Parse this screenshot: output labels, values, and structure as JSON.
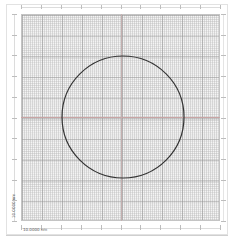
{
  "diagram": {
    "type": "grid-with-circle",
    "grid": {
      "major_divisions_x": 10,
      "major_divisions_y": 10,
      "minor_per_major": 10,
      "background": "#f4f4f4",
      "major_line_color": "#969696",
      "minor_line_color": "#b9b9b9"
    },
    "center_lines": {
      "color": "#c9a4a4"
    },
    "circle": {
      "cx": 123,
      "cy": 117,
      "r": 61,
      "stroke": "#333333",
      "stroke_width": 1.2
    },
    "scale_bar_horizontal": "10.0000  nm",
    "scale_bar_vertical": "10.0000  nm"
  }
}
